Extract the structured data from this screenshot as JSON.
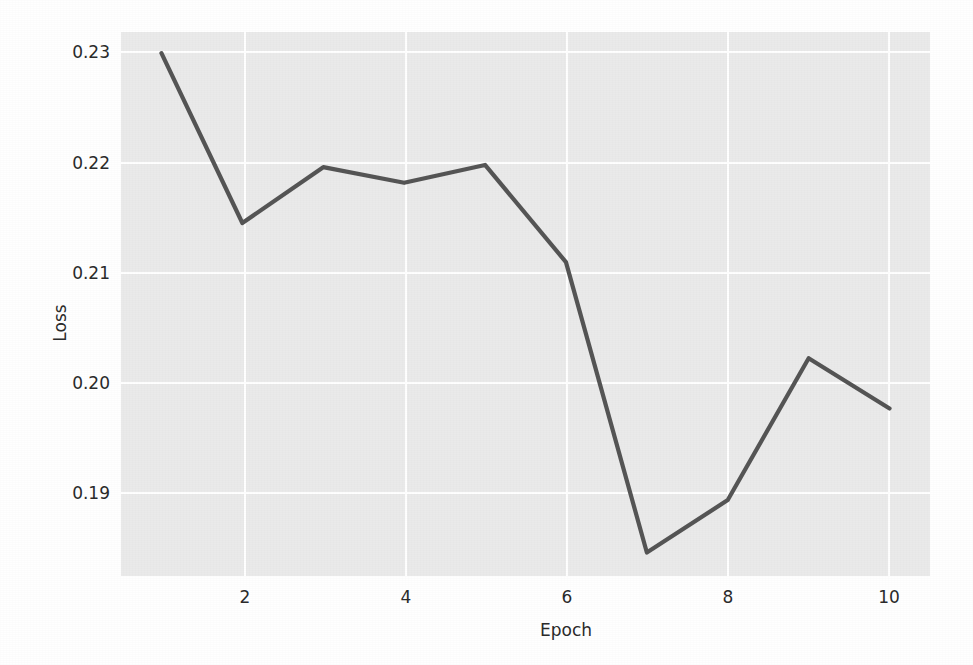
{
  "figure": {
    "background_color": "#ffffff",
    "plot_background_color": "#eaeaea",
    "grid_color": "#ffffff",
    "line_color": "#555555",
    "text_color": "#2b2b2b"
  },
  "chart_data": {
    "type": "line",
    "title": "",
    "xlabel": "Epoch",
    "ylabel": "Loss",
    "x": [
      1,
      2,
      3,
      4,
      5,
      6,
      7,
      8,
      9,
      10
    ],
    "values": [
      0.2293,
      0.2141,
      0.2191,
      0.2177,
      0.2193,
      0.2106,
      0.1846,
      0.1893,
      0.202,
      0.1975
    ],
    "series": [
      {
        "name": "Loss",
        "values": [
          0.2293,
          0.2141,
          0.2191,
          0.2177,
          0.2193,
          0.2106,
          0.1846,
          0.1893,
          0.202,
          0.1975
        ]
      }
    ],
    "xlim": [
      0.5,
      10.5
    ],
    "ylim": [
      0.1825,
      0.2312
    ],
    "xticks": [
      2,
      4,
      6,
      8,
      10
    ],
    "xtick_labels": [
      "2",
      "4",
      "6",
      "8",
      "10"
    ],
    "yticks": [
      0.19,
      0.2,
      0.21,
      0.22,
      0.23
    ],
    "ytick_labels": [
      "0.19",
      "0.20",
      "0.21",
      "0.22",
      "0.23"
    ],
    "grid": true,
    "legend": null,
    "legend_position": "none",
    "annotations": []
  },
  "axes": {
    "y_tick_labels": [
      "0.23",
      "0.22",
      "0.21",
      "0.20",
      "0.19"
    ],
    "x_tick_labels": [
      "2",
      "4",
      "6",
      "8",
      "10"
    ],
    "y_axis_title": "Loss",
    "x_axis_title": "Epoch"
  }
}
